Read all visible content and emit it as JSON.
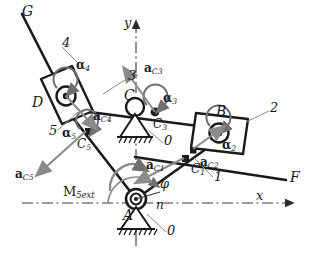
{
  "diagram": {
    "colors": {
      "link": "#1a1a1a",
      "axis": "#3a3a3a",
      "accel_vector": "#7a7a7a",
      "leader": "#8a8a8a",
      "ground_hatch": "#1a1a1a",
      "paper": "#ffffff"
    }
  },
  "labels": {
    "point_G": "G",
    "point_D": "D",
    "point_C": "C",
    "point_B": "B",
    "point_A": "A",
    "point_F": "F"
  },
  "links": {
    "link_1": "1",
    "link_2": "2",
    "link_3": "3",
    "link_4": "4",
    "link_5": "5",
    "ground_0_top": "0",
    "ground_0_bottom": "0"
  },
  "mass_centers": {
    "c1": {
      "name": "C",
      "sub": "1"
    },
    "c2": {
      "name": "C",
      "sub": "2"
    },
    "c3": {
      "name": "C",
      "sub": "3"
    },
    "c4": {
      "name": "C",
      "sub": "4"
    },
    "c5": {
      "name": "C",
      "sub": "5"
    }
  },
  "accelerations": {
    "a_c1": {
      "bold": "a",
      "sub": "C1"
    },
    "a_c2": {
      "bold": "a",
      "sub": "C2"
    },
    "a_c3": {
      "bold": "a",
      "sub": "C3"
    },
    "a_c4": {
      "bold": "a",
      "sub": "C4"
    },
    "a_c5": {
      "bold": "a",
      "sub": "C5"
    }
  },
  "angular_accelerations": {
    "alpha_2": {
      "sym": "α",
      "sub": "2"
    },
    "alpha_3": {
      "sym": "α",
      "sub": "3"
    },
    "alpha_4": {
      "sym": "α",
      "sub": "4"
    },
    "alpha_5": {
      "sym": "α",
      "sub": "5"
    }
  },
  "moment": {
    "sym": "M",
    "sub": "5ext"
  },
  "axes": {
    "x_label": "x",
    "y_label": "y",
    "n_label": "n",
    "phi_label": "φ"
  }
}
